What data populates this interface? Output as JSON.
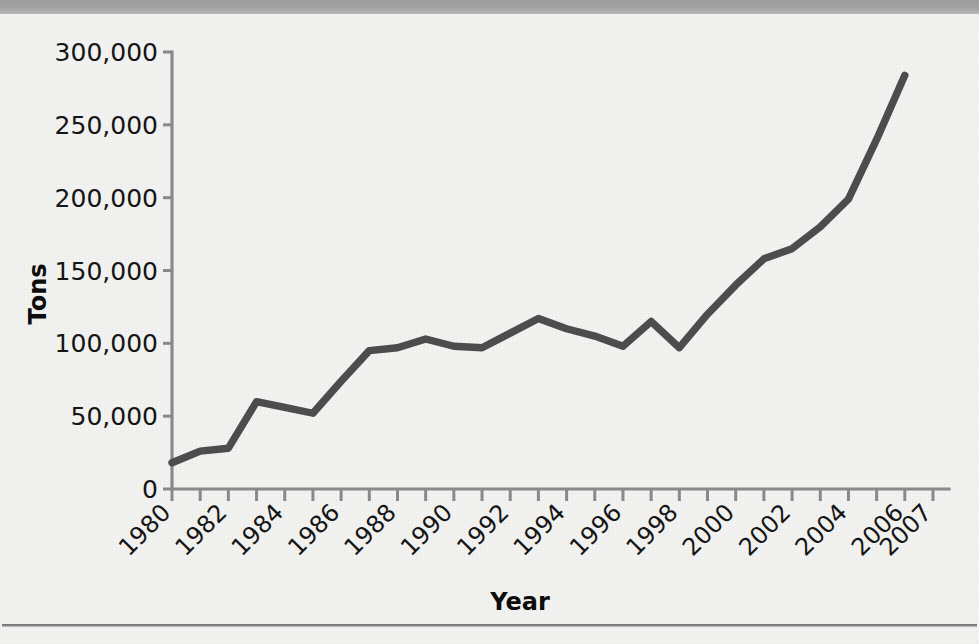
{
  "page": {
    "background_color": "#f2f2f0",
    "banner_color": "#a3a3a3",
    "rule_color": "#6f6f6f"
  },
  "chart_data": {
    "type": "line",
    "title": "",
    "subtitle": "",
    "xlabel": "Year",
    "ylabel": "Tons",
    "series_color": "#4d4d4d",
    "grid": false,
    "legend": false,
    "legend_position": "none",
    "xlim": [
      1980,
      2007
    ],
    "ylim": [
      0,
      300000
    ],
    "ytick_values": [
      0,
      50000,
      100000,
      150000,
      200000,
      250000,
      300000
    ],
    "ytick_labels": [
      "0",
      "50,000",
      "100,000",
      "150,000",
      "200,000",
      "250,000",
      "300,000"
    ],
    "xtick_values": [
      1980,
      1982,
      1984,
      1986,
      1988,
      1990,
      1992,
      1994,
      1996,
      1998,
      2000,
      2002,
      2004,
      2006,
      2007
    ],
    "xtick_labels": [
      "1980",
      "1982",
      "1984",
      "1986",
      "1988",
      "1990",
      "1992",
      "1994",
      "1996",
      "1998",
      "2000",
      "2002",
      "2004",
      "2006",
      "2007"
    ],
    "xtick_label_rotation": -45,
    "x": [
      1980,
      1981,
      1982,
      1983,
      1984,
      1985,
      1986,
      1987,
      1988,
      1989,
      1990,
      1991,
      1992,
      1993,
      1994,
      1995,
      1996,
      1997,
      1998,
      1999,
      2000,
      2001,
      2002,
      2003,
      2004,
      2005,
      2006
    ],
    "values": [
      18000,
      26000,
      28000,
      60000,
      56000,
      52000,
      74000,
      95000,
      97000,
      103000,
      98000,
      97000,
      107000,
      117000,
      110000,
      105000,
      98000,
      115000,
      97000,
      120000,
      140000,
      158000,
      165000,
      180000,
      199000,
      240000,
      284000
    ],
    "series": [
      {
        "name": "Tons",
        "values": [
          18000,
          26000,
          28000,
          60000,
          56000,
          52000,
          74000,
          95000,
          97000,
          103000,
          98000,
          97000,
          107000,
          117000,
          110000,
          105000,
          98000,
          115000,
          97000,
          120000,
          140000,
          158000,
          165000,
          180000,
          199000,
          240000,
          284000
        ]
      }
    ],
    "annotations": []
  }
}
